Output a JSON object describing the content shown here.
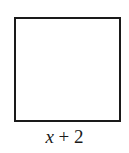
{
  "diagram": {
    "shape": "square",
    "side_label": {
      "variable": "x",
      "operator": " + ",
      "constant": "2",
      "full_text": "x + 2"
    },
    "colors": {
      "stroke": "#1a1a1a",
      "fill": "#ffffff",
      "background": "#ffffff"
    }
  }
}
